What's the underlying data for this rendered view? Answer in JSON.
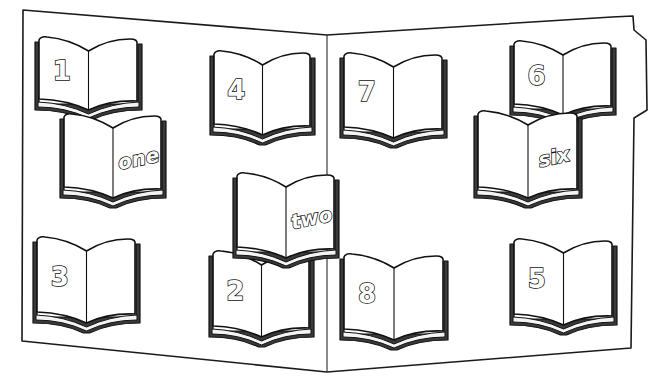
{
  "worksheet": {
    "type": "file-folder matching game",
    "folder": {
      "outline_color": "#1a1a1a",
      "background": "#ffffff",
      "has_right_tab": true
    },
    "books": [
      {
        "id": "book-1",
        "label": "1",
        "kind": "digit",
        "page": "left",
        "x": 35,
        "y": 36,
        "w": 107,
        "h": 84
      },
      {
        "id": "book-one",
        "label": "one",
        "kind": "word",
        "page": "right",
        "x": 60,
        "y": 113,
        "w": 106,
        "h": 95
      },
      {
        "id": "book-4",
        "label": "4",
        "kind": "digit",
        "page": "left",
        "x": 210,
        "y": 50,
        "w": 105,
        "h": 95
      },
      {
        "id": "book-7",
        "label": "7",
        "kind": "digit",
        "page": "left",
        "x": 340,
        "y": 52,
        "w": 107,
        "h": 96
      },
      {
        "id": "book-6",
        "label": "6",
        "kind": "digit",
        "page": "left",
        "x": 510,
        "y": 40,
        "w": 106,
        "h": 85
      },
      {
        "id": "book-six",
        "label": "six",
        "kind": "word",
        "page": "right",
        "x": 474,
        "y": 110,
        "w": 108,
        "h": 98
      },
      {
        "id": "book-2",
        "label": "2",
        "kind": "digit",
        "page": "left",
        "x": 209,
        "y": 250,
        "w": 105,
        "h": 97
      },
      {
        "id": "book-two",
        "label": "two",
        "kind": "word",
        "page": "right",
        "x": 233,
        "y": 172,
        "w": 106,
        "h": 96
      },
      {
        "id": "book-3",
        "label": "3",
        "kind": "digit",
        "page": "left",
        "x": 33,
        "y": 236,
        "w": 107,
        "h": 97
      },
      {
        "id": "book-8",
        "label": "8",
        "kind": "digit",
        "page": "left",
        "x": 340,
        "y": 253,
        "w": 108,
        "h": 97
      },
      {
        "id": "book-5",
        "label": "5",
        "kind": "digit",
        "page": "left",
        "x": 510,
        "y": 238,
        "w": 107,
        "h": 97
      }
    ]
  }
}
